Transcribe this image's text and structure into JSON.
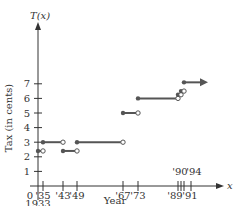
{
  "chart_data": {
    "type": "line",
    "subtype": "step",
    "title": "",
    "xlabel": "Year",
    "ylabel": "Tax (in cents)",
    "y_axis_name": "T(x)",
    "x_axis_name": "x",
    "y_ticks": [
      1,
      2,
      3,
      4,
      5,
      6,
      7
    ],
    "x_ticks": [
      {
        "value": 1933,
        "label": "0",
        "sublabel": "1933"
      },
      {
        "value": 1935,
        "label": "'35"
      },
      {
        "value": 1943,
        "label": "'43"
      },
      {
        "value": 1949,
        "label": "'49"
      },
      {
        "value": 1967,
        "label": "'67"
      },
      {
        "value": 1973,
        "label": "'73"
      },
      {
        "value": 1989,
        "label": "'89"
      },
      {
        "value": 1990,
        "label": "'90"
      },
      {
        "value": 1991,
        "label": "'91"
      },
      {
        "value": 1994,
        "label": "'94"
      }
    ],
    "segments": [
      {
        "x_start": 1933,
        "x_end": 1935,
        "y": 2.4,
        "start": "closed",
        "end": "open"
      },
      {
        "x_start": 1935,
        "x_end": 1943,
        "y": 3,
        "start": "closed",
        "end": "open"
      },
      {
        "x_start": 1943,
        "x_end": 1949,
        "y": 2.4,
        "start": "closed",
        "end": "open"
      },
      {
        "x_start": 1949,
        "x_end": 1967,
        "y": 3,
        "start": "closed",
        "end": "open"
      },
      {
        "x_start": 1967,
        "x_end": 1973,
        "y": 5,
        "start": "closed",
        "end": "open"
      },
      {
        "x_start": 1973,
        "x_end": 1989,
        "y": 6,
        "start": "closed",
        "end": "open"
      },
      {
        "x_start": 1989,
        "x_end": 1990,
        "y": 6.25,
        "start": "closed",
        "end": "open"
      },
      {
        "x_start": 1990,
        "x_end": 1991,
        "y": 6.5,
        "start": "closed",
        "end": "open"
      },
      {
        "x_start": 1991,
        "x_end": null,
        "y": 7.1,
        "start": "closed",
        "end": "arrow"
      }
    ],
    "ylim": [
      0,
      8
    ],
    "grid": false,
    "legend": null,
    "colors": {
      "segment": "#555555",
      "axis": "#333333"
    }
  }
}
